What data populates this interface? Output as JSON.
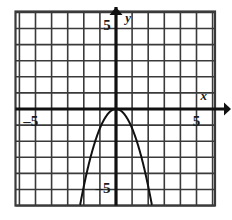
{
  "figure": {
    "background_color": "#ffffff",
    "grid_color": "#3a3a3a",
    "axis_color": "#111111",
    "curve_color": "#111111"
  },
  "axes": {
    "x_axis_name": "x",
    "y_axis_name": "y",
    "x_tick_label_left": "–5",
    "x_tick_label_right": "5",
    "y_tick_label_top": "5",
    "y_tick_label_bottom": "–5"
  },
  "chart_data": {
    "type": "line",
    "title": "",
    "xlabel": "x",
    "ylabel": "y",
    "xlim": [
      -6.3,
      6.2
    ],
    "ylim": [
      -6.1,
      6.1
    ],
    "grid": true,
    "grid_step": 1,
    "legend": "none",
    "annotations": [
      {
        "text": "5",
        "x": -0.55,
        "y": 5.1,
        "role": "y-axis-tick-label"
      },
      {
        "text": "y",
        "x": 0.75,
        "y": 5.6,
        "role": "y-axis-name"
      },
      {
        "text": "–5",
        "x": -5.3,
        "y": -0.85,
        "role": "x-axis-tick-label"
      },
      {
        "text": "5",
        "x": 5.0,
        "y": -0.85,
        "role": "x-axis-tick-label"
      },
      {
        "text": "x",
        "x": 5.45,
        "y": 0.75,
        "role": "x-axis-name"
      },
      {
        "text": "–5",
        "x": -0.8,
        "y": -5.0,
        "role": "y-axis-tick-label"
      }
    ],
    "series": [
      {
        "name": "parabola",
        "equation": "y = -1.2x^2",
        "vertex": [
          0,
          0
        ],
        "opens": "down",
        "x": [
          -2.25,
          -2.0,
          -1.75,
          -1.5,
          -1.25,
          -1.0,
          -0.75,
          -0.5,
          -0.25,
          0,
          0.25,
          0.5,
          0.75,
          1.0,
          1.25,
          1.5,
          1.75,
          2.0,
          2.25
        ],
        "values": [
          -6.08,
          -4.8,
          -3.68,
          -2.7,
          -1.88,
          -1.2,
          -0.68,
          -0.3,
          -0.08,
          0,
          -0.08,
          -0.3,
          -0.68,
          -1.2,
          -1.88,
          -2.7,
          -3.68,
          -4.8,
          -6.08
        ]
      }
    ]
  }
}
